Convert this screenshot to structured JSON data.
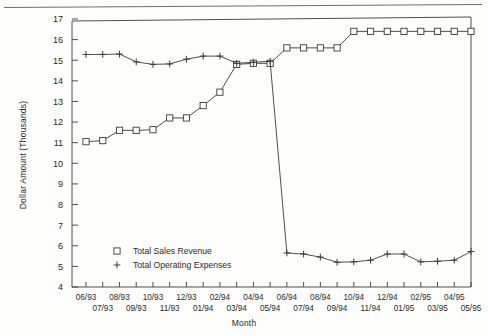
{
  "figure": {
    "y_axis_title": "Dollar Amount (Thousands)",
    "x_axis_title": "Month"
  },
  "chart_data": {
    "type": "line",
    "title": "",
    "xlabel": "Month",
    "ylabel": "Dollar Amount (Thousands)",
    "ylim": [
      4,
      17
    ],
    "yticks": [
      4,
      5,
      6,
      7,
      8,
      9,
      10,
      11,
      12,
      13,
      14,
      15,
      16,
      17
    ],
    "grid": false,
    "legend_position": "inside-lower-left",
    "marker_style": {
      "Total Sales Revenue": "open-square",
      "Total Operating Expenses": "plus"
    },
    "line_color": "#3b3b3b",
    "categories": [
      "06/93",
      "07/93",
      "08/93",
      "09/93",
      "10/93",
      "11/93",
      "12/93",
      "01/94",
      "02/94",
      "03/94",
      "04/94",
      "05/94",
      "06/94",
      "07/94",
      "08/94",
      "09/94",
      "10/94",
      "11/94",
      "12/94",
      "01/95",
      "02/95",
      "03/95",
      "04/95",
      "05/95"
    ],
    "tick_labels_top_row": [
      "06/93",
      "08/93",
      "10/93",
      "12/93",
      "02/94",
      "04/94",
      "06/94",
      "08/94",
      "10/94",
      "12/94",
      "02/95",
      "04/95"
    ],
    "tick_labels_bottom_row": [
      "07/93",
      "09/93",
      "11/93",
      "01/94",
      "03/94",
      "05/94",
      "07/94",
      "09/94",
      "11/94",
      "01/95",
      "03/95",
      "05/95"
    ],
    "series": [
      {
        "name": "Total Sales Revenue",
        "marker": "open-square",
        "values": [
          11.05,
          11.1,
          11.6,
          11.6,
          11.63,
          12.2,
          12.2,
          12.8,
          13.45,
          14.8,
          14.85,
          14.85,
          15.6,
          15.6,
          15.6,
          15.6,
          16.4,
          16.4,
          16.4,
          16.4,
          16.4,
          16.4,
          16.4,
          16.4
        ]
      },
      {
        "name": "Total Operating Expenses",
        "marker": "plus",
        "values": [
          15.28,
          15.28,
          15.3,
          14.92,
          14.8,
          14.82,
          15.05,
          15.2,
          15.2,
          14.85,
          14.9,
          14.95,
          5.65,
          5.6,
          5.45,
          5.2,
          5.22,
          5.3,
          5.6,
          5.6,
          5.22,
          5.25,
          5.3,
          5.72
        ]
      }
    ],
    "legend": [
      {
        "label": "Total Sales Revenue",
        "marker": "open-square"
      },
      {
        "label": "Total Operating Expenses",
        "marker": "plus"
      }
    ]
  }
}
